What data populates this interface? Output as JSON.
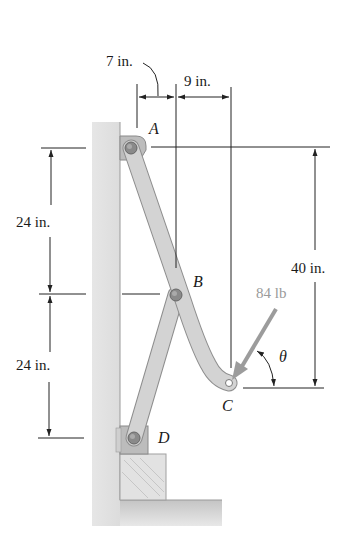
{
  "figure": {
    "type": "mechanism-statics-problem",
    "points": {
      "A": {
        "label": "A"
      },
      "B": {
        "label": "B"
      },
      "C": {
        "label": "C"
      },
      "D": {
        "label": "D"
      }
    },
    "dimensions": {
      "top_left": "7 in.",
      "top_right": "9 in.",
      "upper_vertical": "24 in.",
      "lower_vertical": "24 in.",
      "right_vertical": "40 in."
    },
    "force": {
      "magnitude_label": "84 lb",
      "angle_label": "θ"
    },
    "colors": {
      "member_fill": "#cfcfcf",
      "member_stroke": "#8e8e8e",
      "wall_fill": "#d4d4d4",
      "force_arrow": "#9c9c9c",
      "dimension_line": "#222222"
    }
  }
}
